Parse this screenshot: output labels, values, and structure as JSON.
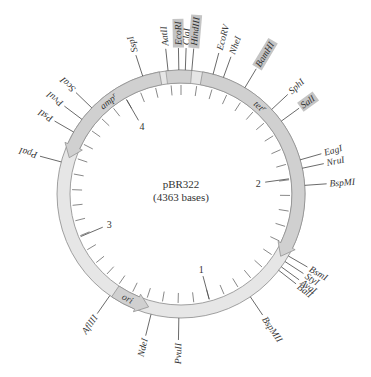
{
  "plasmid": {
    "name": "pBR322",
    "size_label": "(4363 bases)",
    "total_bp": 4363
  },
  "colors": {
    "ring_fill": "#e6e6e6",
    "ring_stroke": "#8a8a8a",
    "gene_fill": "#d0d0d0",
    "highlight_box": "#c4c4c4",
    "text": "#333333"
  },
  "kb_markers": [
    {
      "label": "1",
      "angle": 165
    },
    {
      "label": "2",
      "angle": 82
    },
    {
      "label": "3",
      "angle": 247
    },
    {
      "label": "4",
      "angle": 330
    }
  ],
  "features": [
    {
      "label": "amp",
      "superscript": "r",
      "type": "arrow",
      "start_angle": 350,
      "end_angle": 288,
      "text_angle": 322
    },
    {
      "label": "tet",
      "superscript": "r",
      "type": "arrow",
      "start_angle": 10,
      "end_angle": 122,
      "text_angle": 42
    },
    {
      "label": "ori",
      "type": "arrow",
      "start_angle": 214,
      "end_angle": 196,
      "text_angle": 207
    }
  ],
  "sites": [
    {
      "label": "SspI",
      "angle": 342,
      "highlight": false
    },
    {
      "label": "AatII",
      "angle": 354,
      "highlight": false
    },
    {
      "label": "EcoRI",
      "angle": 359,
      "highlight": true
    },
    {
      "label": "ClaI",
      "angle": 2,
      "highlight": false
    },
    {
      "label": "HindIII",
      "angle": 5,
      "highlight": true
    },
    {
      "label": "EcoRV",
      "angle": 15,
      "highlight": false
    },
    {
      "label": "NheI",
      "angle": 20,
      "highlight": false
    },
    {
      "label": "BamHI",
      "angle": 31,
      "highlight": true
    },
    {
      "label": "SphI",
      "angle": 47,
      "highlight": false
    },
    {
      "label": "SalI",
      "angle": 54,
      "highlight": true
    },
    {
      "label": "EagI",
      "angle": 74,
      "highlight": false
    },
    {
      "label": "NruI",
      "angle": 78,
      "highlight": false
    },
    {
      "label": "BspMI",
      "angle": 86,
      "highlight": false
    },
    {
      "label": "BsmI",
      "angle": 120,
      "highlight": false
    },
    {
      "label": "StyI",
      "angle": 123,
      "highlight": false
    },
    {
      "label": "AvaI",
      "angle": 126,
      "highlight": false
    },
    {
      "label": "BalI",
      "angle": 128,
      "highlight": false
    },
    {
      "label": "BspMII",
      "angle": 146,
      "highlight": false
    },
    {
      "label": "PvuII",
      "angle": 181,
      "highlight": false
    },
    {
      "label": "NdeI",
      "angle": 194,
      "highlight": false
    },
    {
      "label": "AflIII",
      "angle": 215,
      "highlight": false
    },
    {
      "label": "PpaI",
      "angle": 285,
      "highlight": false
    },
    {
      "label": "PstI",
      "angle": 300,
      "highlight": false
    },
    {
      "label": "PvuI",
      "angle": 307,
      "highlight": false
    },
    {
      "label": "ScaI",
      "angle": 314,
      "highlight": false
    }
  ]
}
